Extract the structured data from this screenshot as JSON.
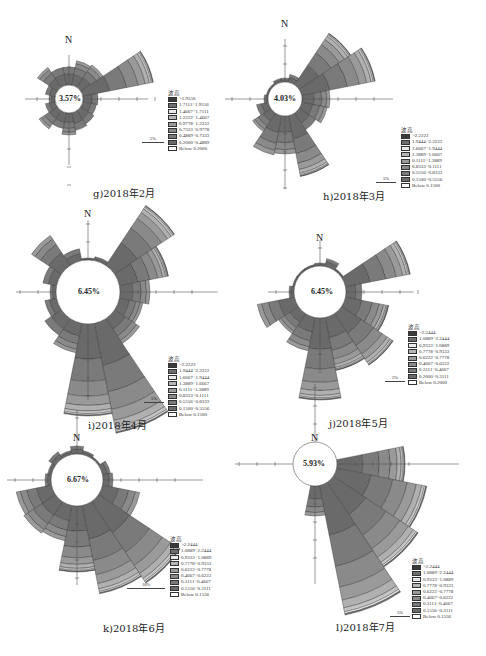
{
  "figure": {
    "legend_title": "波高",
    "legend_colors": [
      "#3a3a3a",
      "#6e6e6e",
      "#e9e9e9",
      "#b5b5b5",
      "#9a9a9a",
      "#8a8a8a",
      "#7a7a7a",
      "#6a6a6a",
      "#ffffff"
    ]
  },
  "panels": [
    {
      "id": "g",
      "caption": "g)2018年2月",
      "calm": "3.57%",
      "scale_label": "5%",
      "legend": [
        ">1.9556",
        "1.7111~1.9556",
        "1.4667~1.7111",
        "1.2222~1.4667",
        "0.9778~1.2222",
        "0.7333~0.9778",
        "0.4889~0.7333",
        "0.2000~0.4889",
        "Below  0.2000"
      ]
    },
    {
      "id": "h",
      "caption": "h)2018年3月",
      "calm": "4.03%",
      "scale_label": "5%",
      "legend": [
        ">2.2222",
        "1.9444~2.2222",
        "1.6667~1.9444",
        "1.3889~1.6667",
        "0.1111~1.3889",
        "0.8333~0.1111",
        "0.5556~0.8333",
        "0.1500~0.5556",
        "Below  0.1500"
      ]
    },
    {
      "id": "i",
      "caption": "i)2018年4月",
      "calm": "6.45%",
      "scale_label": "5%",
      "legend": [
        ">2.2222",
        "1.9444~2.2222",
        "1.6667~1.9444",
        "1.3889~1.6667",
        "0.1111~1.3889",
        "0.8333~0.1111",
        "0.5556~0.8333",
        "0.1500~0.5556",
        "Below  0.1500"
      ]
    },
    {
      "id": "j",
      "caption": "j)2018年5月",
      "calm": "6.45%",
      "scale_label": "5%",
      "legend": [
        ">2.2444",
        "1.0889~2.2444",
        "0.9333~1.0889",
        "0.7778~0.9333",
        "0.6222~0.7778",
        "0.4667~0.6222",
        "0.3111~0.4667",
        "0.2000~0.3111",
        "Below  0.2000"
      ]
    },
    {
      "id": "k",
      "caption": "k)2018年6月",
      "calm": "6.67%",
      "scale_label": "10%",
      "legend": [
        ">2.2444",
        "1.0889~2.2444",
        "0.9333~1.0889",
        "0.7778~0.9333",
        "0.6222~0.7778",
        "0.4667~0.6222",
        "0.3111~0.4667",
        "0.1556~0.3111",
        "Below  0.1556"
      ]
    },
    {
      "id": "l",
      "caption": "l)2018年7月",
      "calm": "5.93%",
      "scale_label": "5%",
      "legend": [
        ">2.2444",
        "1.0889~2.2444",
        "0.9333~1.0889",
        "0.7778~0.9333",
        "0.6222~0.7778",
        "0.4667~0.6222",
        "0.3111~0.4667",
        "0.1556~0.3111",
        "Below  0.1556"
      ]
    }
  ],
  "chart_data": [
    {
      "type": "rose",
      "title": "g)2018年2月",
      "calm_pct": 3.57,
      "scale": "5%",
      "directions": [
        "N",
        "NNE",
        "NE",
        "ENE",
        "E",
        "ESE",
        "SE",
        "SSE",
        "S",
        "SSW",
        "SW",
        "WSW",
        "W",
        "WNW",
        "NW",
        "NNW"
      ],
      "outer_radius_px": [
        18,
        25,
        27,
        72,
        15,
        14,
        16,
        18,
        22,
        16,
        22,
        10,
        6,
        10,
        24,
        18
      ]
    },
    {
      "type": "rose",
      "title": "h)2018年3月",
      "calm_pct": 4.03,
      "scale": "5%",
      "directions": [
        "N",
        "NNE",
        "NE",
        "ENE",
        "E",
        "ESE",
        "SE",
        "SSE",
        "S",
        "SSW",
        "SW",
        "WSW",
        "W",
        "WNW",
        "NW",
        "NNW"
      ],
      "outer_radius_px": [
        4,
        8,
        62,
        75,
        28,
        26,
        20,
        62,
        38,
        40,
        22,
        12,
        4,
        2,
        2,
        4
      ]
    },
    {
      "type": "rose",
      "title": "i)2018年4月",
      "calm_pct": 6.45,
      "scale": "5%",
      "directions": [
        "N",
        "NNE",
        "NE",
        "ENE",
        "E",
        "ESE",
        "SE",
        "SSE",
        "S",
        "SSW",
        "SW",
        "WSW",
        "W",
        "WNW",
        "NW",
        "NNW"
      ],
      "outer_radius_px": [
        2,
        4,
        72,
        50,
        30,
        24,
        30,
        112,
        92,
        30,
        20,
        12,
        6,
        14,
        36,
        12
      ]
    },
    {
      "type": "rose",
      "title": "j)2018年5月",
      "calm_pct": 6.45,
      "scale": "5%",
      "directions": [
        "N",
        "NNE",
        "NE",
        "ENE",
        "E",
        "ESE",
        "SE",
        "SSE",
        "S",
        "SSW",
        "SW",
        "WSW",
        "W",
        "WNW",
        "NW",
        "NNW"
      ],
      "outer_radius_px": [
        3,
        8,
        2,
        66,
        16,
        44,
        62,
        54,
        82,
        34,
        24,
        38,
        5,
        2,
        2,
        2
      ]
    },
    {
      "type": "rose",
      "title": "k)2018年6月",
      "calm_pct": 6.67,
      "scale": "10%",
      "directions": [
        "N",
        "NNE",
        "NE",
        "ENE",
        "E",
        "ESE",
        "SE",
        "SSE",
        "S",
        "SSW",
        "SW",
        "WSW",
        "W",
        "WNW",
        "NW",
        "NNW"
      ],
      "outer_radius_px": [
        8,
        4,
        2,
        8,
        10,
        38,
        98,
        90,
        66,
        36,
        38,
        36,
        6,
        4,
        8,
        4
      ]
    },
    {
      "type": "rose",
      "title": "l)2018年7月",
      "calm_pct": 5.93,
      "scale": "5%",
      "directions": [
        "N",
        "NNE",
        "NE",
        "ENE",
        "E",
        "ESE",
        "SE",
        "SSE",
        "S",
        "SSW",
        "SW",
        "WSW",
        "W",
        "WNW",
        "NW",
        "NNW"
      ],
      "outer_radius_px": [
        0,
        0,
        0,
        0,
        68,
        92,
        102,
        132,
        30,
        0,
        0,
        0,
        0,
        0,
        0,
        0
      ]
    }
  ]
}
